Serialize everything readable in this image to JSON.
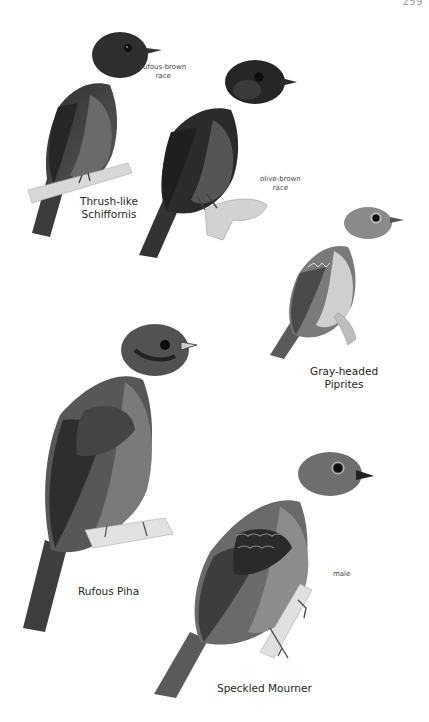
{
  "page": {
    "page_number": "259"
  },
  "plates": [
    {
      "species": "Thrush-like Schiffornis",
      "species_line1": "Thrush-like",
      "species_line2": "Schiffornis",
      "figures": [
        {
          "note_line1": "rufous-brown",
          "note_line2": "race"
        },
        {
          "note_line1": "olive-brown",
          "note_line2": "race"
        }
      ]
    },
    {
      "species": "Gray-headed Piprites",
      "species_line1": "Gray-headed",
      "species_line2": "Piprites"
    },
    {
      "species": "Rufous Piha",
      "species_line1": "Rufous Piha"
    },
    {
      "species": "Speckled Mourner",
      "species_line1": "Speckled Mourner",
      "figures": [
        {
          "note_line1": "male"
        }
      ]
    }
  ],
  "colors": {
    "background": "#ffffff",
    "text": "#231f20",
    "bird_dark": "#3a3a3a",
    "bird_mid": "#6e6e6e",
    "bird_light": "#a8a8a8",
    "perch": "#cfcfcf"
  }
}
